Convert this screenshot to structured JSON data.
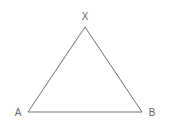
{
  "diagram": {
    "type": "triangle",
    "stroke_color": "#707070",
    "label_color": "#666666",
    "vertices": [
      {
        "name": "X",
        "x": 85,
        "y": 27,
        "label": "X",
        "label_x": 85,
        "label_y": 20
      },
      {
        "name": "A",
        "x": 28,
        "y": 112,
        "label": "A",
        "label_x": 18,
        "label_y": 116
      },
      {
        "name": "B",
        "x": 142,
        "y": 112,
        "label": "B",
        "label_x": 152,
        "label_y": 116
      }
    ]
  }
}
